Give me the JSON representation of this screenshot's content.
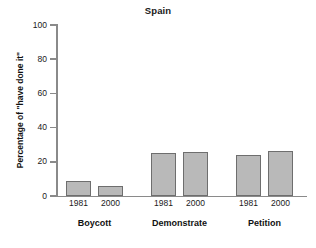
{
  "chart_data": {
    "type": "bar",
    "title": "Spain",
    "xlabel": "",
    "ylabel": "Percentage of \"have done it\"",
    "ylim": [
      0,
      100
    ],
    "yticks": [
      0,
      20,
      40,
      60,
      80,
      100
    ],
    "ytick_labels": [
      "0",
      "20",
      "40",
      "60",
      "80",
      "100"
    ],
    "grid": false,
    "legend": "none",
    "categories": [
      "Boycott",
      "Demonstrate",
      "Petition"
    ],
    "x": [
      "1981",
      "2000"
    ],
    "series": [
      {
        "name": "1981",
        "values": [
          9,
          25,
          24
        ]
      },
      {
        "name": "2000",
        "values": [
          6,
          26,
          26.5
        ]
      }
    ],
    "bars": [
      {
        "group": "Boycott",
        "year": "1981",
        "value": 9
      },
      {
        "group": "Boycott",
        "year": "2000",
        "value": 6
      },
      {
        "group": "Demonstrate",
        "year": "1981",
        "value": 25
      },
      {
        "group": "Demonstrate",
        "year": "2000",
        "value": 26
      },
      {
        "group": "Petition",
        "year": "1981",
        "value": 24
      },
      {
        "group": "Petition",
        "year": "2000",
        "value": 26.5
      }
    ],
    "colors": {
      "bar_fill": "#b9b9b9",
      "bar_border": "#6e6e6e",
      "axis": "#8a8a8a",
      "text": "#1a1a1a",
      "background": "#ffffff"
    }
  }
}
